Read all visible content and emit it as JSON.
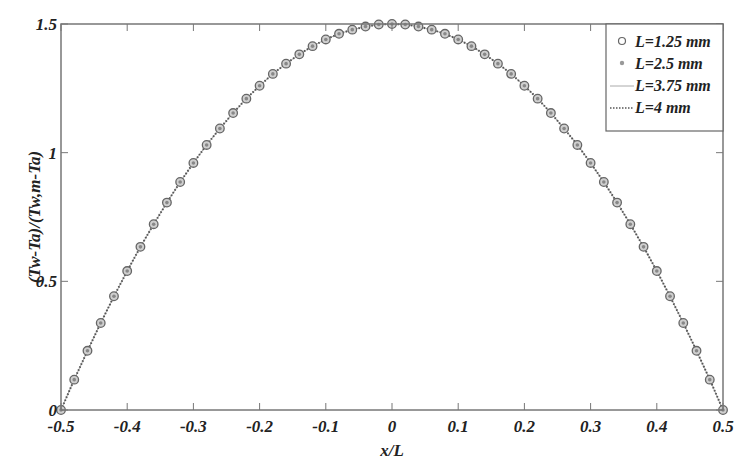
{
  "chart_data": {
    "type": "line",
    "title": "",
    "xlabel": "x/L",
    "ylabel": "(Tw-Ta)/(Tw,m-Ta)",
    "xlim": [
      -0.5,
      0.5
    ],
    "ylim": [
      0,
      1.5
    ],
    "grid": false,
    "legend_position": "upper right",
    "x_ticks": [
      -0.5,
      -0.4,
      -0.3,
      -0.2,
      -0.1,
      0,
      0.1,
      0.2,
      0.3,
      0.4,
      0.5
    ],
    "x_tick_labels": [
      "-0.5",
      "-0.4",
      "-0.3",
      "-0.2",
      "-0.1",
      "0",
      "0.1",
      "0.2",
      "0.3",
      "0.4",
      "0.5"
    ],
    "y_ticks": [
      0,
      0.5,
      1,
      1.5
    ],
    "y_tick_labels": [
      "0",
      "0.5",
      "1",
      "1.5"
    ],
    "x": [
      -0.5,
      -0.48,
      -0.46,
      -0.44,
      -0.42,
      -0.4,
      -0.38,
      -0.36,
      -0.34,
      -0.32,
      -0.3,
      -0.28,
      -0.26,
      -0.24,
      -0.22,
      -0.2,
      -0.18,
      -0.16,
      -0.14,
      -0.12,
      -0.1,
      -0.08,
      -0.06,
      -0.04,
      -0.02,
      0,
      0.02,
      0.04,
      0.06,
      0.08,
      0.1,
      0.12,
      0.14,
      0.16,
      0.18,
      0.2,
      0.22,
      0.24,
      0.26,
      0.28,
      0.3,
      0.32,
      0.34,
      0.36,
      0.38,
      0.4,
      0.42,
      0.44,
      0.46,
      0.48,
      0.5
    ],
    "series": [
      {
        "name": "L=1.25 mm",
        "style": "circle-marker",
        "color": "#777777",
        "values": [
          0,
          0.118,
          0.23,
          0.338,
          0.442,
          0.54,
          0.634,
          0.722,
          0.806,
          0.886,
          0.96,
          1.03,
          1.094,
          1.154,
          1.21,
          1.26,
          1.306,
          1.346,
          1.382,
          1.414,
          1.44,
          1.462,
          1.478,
          1.49,
          1.498,
          1.5,
          1.498,
          1.49,
          1.478,
          1.462,
          1.44,
          1.414,
          1.382,
          1.346,
          1.306,
          1.26,
          1.21,
          1.154,
          1.094,
          1.03,
          0.96,
          0.886,
          0.806,
          0.722,
          0.634,
          0.54,
          0.442,
          0.338,
          0.23,
          0.118,
          0
        ]
      },
      {
        "name": "L=2.5 mm",
        "style": "dot-marker",
        "color": "#888888",
        "values": [
          0,
          0.118,
          0.23,
          0.338,
          0.442,
          0.54,
          0.634,
          0.722,
          0.806,
          0.886,
          0.96,
          1.03,
          1.094,
          1.154,
          1.21,
          1.26,
          1.306,
          1.346,
          1.382,
          1.414,
          1.44,
          1.462,
          1.478,
          1.49,
          1.498,
          1.5,
          1.498,
          1.49,
          1.478,
          1.462,
          1.44,
          1.414,
          1.382,
          1.346,
          1.306,
          1.26,
          1.21,
          1.154,
          1.094,
          1.03,
          0.96,
          0.886,
          0.806,
          0.722,
          0.634,
          0.54,
          0.442,
          0.338,
          0.23,
          0.118,
          0
        ]
      },
      {
        "name": "L=3.75 mm",
        "style": "solid-line",
        "color": "#999999",
        "values": [
          0,
          0.118,
          0.23,
          0.338,
          0.442,
          0.54,
          0.634,
          0.722,
          0.806,
          0.886,
          0.96,
          1.03,
          1.094,
          1.154,
          1.21,
          1.26,
          1.306,
          1.346,
          1.382,
          1.414,
          1.44,
          1.462,
          1.478,
          1.49,
          1.498,
          1.5,
          1.498,
          1.49,
          1.478,
          1.462,
          1.44,
          1.414,
          1.382,
          1.346,
          1.306,
          1.26,
          1.21,
          1.154,
          1.094,
          1.03,
          0.96,
          0.886,
          0.806,
          0.722,
          0.634,
          0.54,
          0.442,
          0.338,
          0.23,
          0.118,
          0
        ]
      },
      {
        "name": "L=4 mm",
        "style": "dotted-line",
        "color": "#555555",
        "values": [
          0,
          0.118,
          0.23,
          0.338,
          0.442,
          0.54,
          0.634,
          0.722,
          0.806,
          0.886,
          0.96,
          1.03,
          1.094,
          1.154,
          1.21,
          1.26,
          1.306,
          1.346,
          1.382,
          1.414,
          1.44,
          1.462,
          1.478,
          1.49,
          1.498,
          1.5,
          1.498,
          1.49,
          1.478,
          1.462,
          1.44,
          1.414,
          1.382,
          1.346,
          1.306,
          1.26,
          1.21,
          1.154,
          1.094,
          1.03,
          0.96,
          0.886,
          0.806,
          0.722,
          0.634,
          0.54,
          0.442,
          0.338,
          0.23,
          0.118,
          0
        ]
      }
    ]
  },
  "colors": {
    "axis": "#666666",
    "marker": "#777777",
    "line": "#555555",
    "text": "#222222"
  }
}
